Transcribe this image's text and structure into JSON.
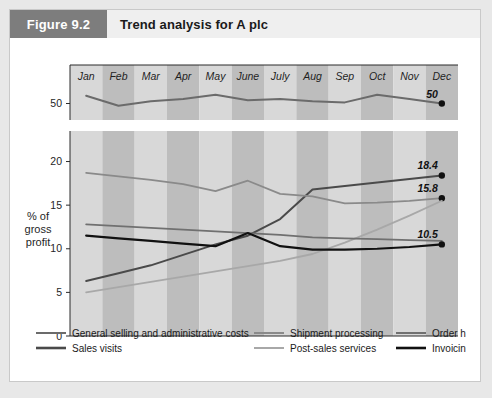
{
  "figure": {
    "number": "Figure 9.2",
    "title": "Trend analysis for A plc"
  },
  "chart_data": {
    "type": "line",
    "title": "Trend analysis for A plc",
    "xlabel": "",
    "ylabel": "% of\ngross\nprofit",
    "ylabel_lines": [
      "% of",
      "gross",
      "profit"
    ],
    "categories": [
      "Jan",
      "Feb",
      "Mar",
      "Apr",
      "May",
      "June",
      "July",
      "Aug",
      "Sep",
      "Oct",
      "Nov",
      "Dec"
    ],
    "axis_break": true,
    "upper_panel": {
      "ticks": [
        "50"
      ],
      "tick_values": [
        50
      ],
      "ylim": [
        48.5,
        53.5
      ]
    },
    "lower_panel": {
      "ticks": [
        "0",
        "5",
        "10",
        "15",
        "20"
      ],
      "tick_values": [
        0,
        5,
        10,
        15,
        20
      ],
      "ylim": [
        0,
        23.5
      ]
    },
    "grid": false,
    "legend_position": "bottom",
    "band_shading": true,
    "series": [
      {
        "name": "General selling and administrative costs",
        "color": "#6b6b6b",
        "width": 2.0,
        "panel": "upper",
        "end_label": "50",
        "end_marker": true,
        "values": [
          50.7,
          49.8,
          50.2,
          50.4,
          50.8,
          50.3,
          50.4,
          50.2,
          50.1,
          50.8,
          50.4,
          50.0
        ]
      },
      {
        "name": "Sales visits",
        "color": "#4a4a4a",
        "width": 2.0,
        "panel": "lower",
        "end_label": "18.4",
        "end_marker": true,
        "values": [
          6.3,
          7.2,
          8.1,
          9.3,
          10.5,
          11.5,
          13.4,
          16.8,
          17.2,
          17.6,
          18.0,
          18.4
        ]
      },
      {
        "name": "Shipment processing",
        "color": "#8a8a8a",
        "width": 1.8,
        "panel": "lower",
        "end_label": "15.8",
        "end_marker": true,
        "values": [
          18.7,
          18.3,
          17.9,
          17.4,
          16.6,
          17.8,
          16.3,
          16.0,
          15.2,
          15.3,
          15.5,
          15.8
        ]
      },
      {
        "name": "Post-sales services",
        "color": "#a8a8a8",
        "width": 1.8,
        "panel": "lower",
        "end_label": "",
        "end_marker": false,
        "values": [
          5.0,
          5.6,
          6.2,
          6.8,
          7.4,
          8.0,
          8.6,
          9.4,
          10.7,
          12.2,
          13.8,
          15.5
        ]
      },
      {
        "name": "Order handling",
        "color": "#707070",
        "width": 1.8,
        "panel": "lower",
        "end_label": "",
        "end_marker": false,
        "values": [
          12.8,
          12.6,
          12.4,
          12.2,
          12.0,
          11.8,
          11.6,
          11.3,
          11.2,
          11.1,
          11.0,
          10.9
        ]
      },
      {
        "name": "Invoicing",
        "color": "#111111",
        "width": 2.2,
        "panel": "lower",
        "end_label": "10.5",
        "end_marker": true,
        "values": [
          11.5,
          11.2,
          10.9,
          10.6,
          10.3,
          11.8,
          10.3,
          9.9,
          9.9,
          10.0,
          10.2,
          10.5
        ]
      }
    ],
    "end_labels": [
      "50",
      "18.4",
      "15.8",
      "10.5"
    ]
  },
  "legend": {
    "column1": [
      {
        "label": "General selling and administrative costs",
        "color": "#6b6b6b",
        "width": 2.0
      },
      {
        "label": "Sales visits",
        "color": "#4a4a4a",
        "width": 2.6
      }
    ],
    "column2": [
      {
        "label": "Shipment processing",
        "color": "#8a8a8a",
        "width": 2.0
      },
      {
        "label": "Post-sales services",
        "color": "#a8a8a8",
        "width": 2.0
      }
    ],
    "column3": [
      {
        "label": "Order handling",
        "color": "#707070",
        "width": 2.0
      },
      {
        "label": "Invoicing",
        "color": "#111111",
        "width": 2.6
      }
    ]
  },
  "colors": {
    "band_light": "#d8d8d8",
    "band_dark": "#bdbdbd",
    "header_bg": "#efefef",
    "fig_number_bg": "#7d7d7d",
    "card_bg": "#ffffff",
    "page_bg": "#e8e8e8"
  }
}
